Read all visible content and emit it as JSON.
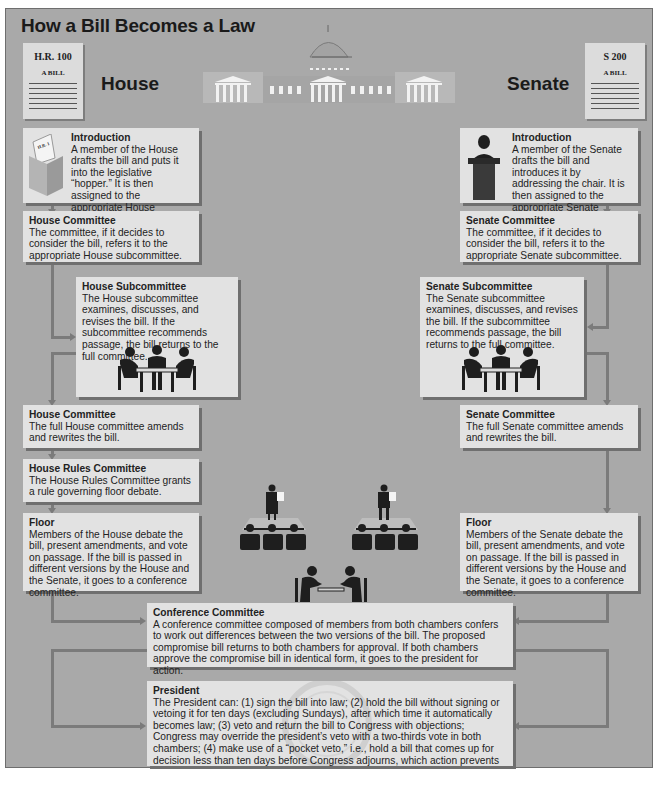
{
  "title": "How a Bill Becomes a Law",
  "header": {
    "house_label": "House",
    "senate_label": "Senate",
    "house_bill": {
      "number": "H.R. 100",
      "subtitle": "A BILL"
    },
    "senate_bill": {
      "number": "S 200",
      "subtitle": "A BILL"
    },
    "hopper_label": "H.R. 1"
  },
  "house": {
    "introduction": {
      "heading": "Introduction",
      "text": "A member of the House drafts the bill and puts it into the legislative “hopper.”  It is then assigned to the appropriate House committee."
    },
    "committee": {
      "heading": "House Committee",
      "text": "The committee, if it decides to consider the bill, refers it to the appropriate House subcommittee."
    },
    "subcommittee": {
      "heading": "House Subcommittee",
      "text": "The House subcommittee examines, discusses, and revises the bill.  If the subcommittee recommends passage, the bill returns to the full committee."
    },
    "full_committee": {
      "heading": "House Committee",
      "text": "The full House committee amends and rewrites the bill."
    },
    "rules_committee": {
      "heading": "House Rules Committee",
      "text": "The House Rules Committee grants a rule governing floor debate."
    },
    "floor": {
      "heading": "Floor",
      "text": "Members of the House debate the bill, present amendments, and vote on passage.  If the bill is passed in different versions by the House and the Senate, it goes to a conference committee."
    }
  },
  "senate": {
    "introduction": {
      "heading": "Introduction",
      "text": "A member of the Senate drafts the bill and introduces it by addressing the chair. It is then assigned to the appropriate Senate committee."
    },
    "committee": {
      "heading": "Senate Committee",
      "text": "The committee, if it decides to consider the bill, refers it to the appropriate Senate subcommittee."
    },
    "subcommittee": {
      "heading": "Senate Subcommittee",
      "text": "The Senate subcommittee examines, discusses, and revises the bill.  If the subcommittee recommends passage, the bill returns to the full committee."
    },
    "full_committee": {
      "heading": "Senate Committee",
      "text": "The full Senate committee amends and rewrites the bill."
    },
    "floor": {
      "heading": "Floor",
      "text": "Members of the Senate debate the bill, present amendments, and vote on passage.  If the bill is passed in different versions by the House and the Senate, it goes to a conference committee."
    }
  },
  "conference": {
    "heading": "Conference Committee",
    "text": "A conference committee composed of members from both chambers confers to work out differences between the two versions of the bill.  The proposed compromise bill returns to both chambers for approval.  If both chambers approve the compromise bill in identical form, it goes to the president for action."
  },
  "president": {
    "heading": "President",
    "text": "The President can: (1) sign the bill into law; (2) hold the bill without signing or vetoing it for ten days (excluding Sundays), after which time it automatically becomes law; (3) veto and return the bill to Congress with objections; Congress may override the president’s veto with a two-thirds vote in both chambers; (4) make use of a “pocket veto,” i.e., hold a bill that comes up for decision less than ten days before Congress adjourns, which action prevents the bill from becoming law."
  },
  "colors": {
    "background": "#a9a9a9",
    "box": "#e2e2e2",
    "connector": "#7b7b7b",
    "capitol_wing": "#b9b9b9",
    "text": "#222222"
  }
}
